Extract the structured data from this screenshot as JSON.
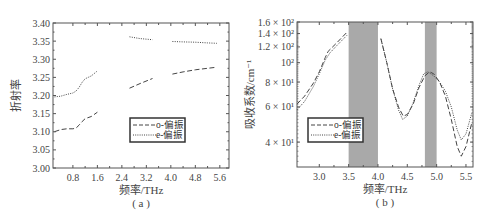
{
  "chart_data": [
    {
      "id": "a",
      "type": "line",
      "caption": "( a )",
      "xlabel": "频率/THz",
      "ylabel": "折射率",
      "xlim": [
        0.15,
        5.9
      ],
      "ylim": [
        3.0,
        3.4
      ],
      "xticks": [
        0.8,
        1.6,
        2.4,
        3.2,
        4.0,
        4.8,
        5.6
      ],
      "xtick_labels": [
        "0.8",
        "1.6",
        "2.4",
        "3.2",
        "4.0",
        "4.8",
        "5.6"
      ],
      "yticks": [
        3.0,
        3.05,
        3.1,
        3.15,
        3.2,
        3.25,
        3.3,
        3.35,
        3.4
      ],
      "ytick_labels": [
        "3.00",
        "3.05",
        "3.10",
        "3.15",
        "3.20",
        "3.25",
        "3.30",
        "3.35",
        "3.40"
      ],
      "grid": false,
      "legend_position": "lower right",
      "series": [
        {
          "name": "o-偏振",
          "style": "dashed",
          "segments": [
            [
              [
                0.2,
                3.1
              ],
              [
                0.4,
                3.106
              ],
              [
                0.6,
                3.108
              ],
              [
                0.8,
                3.108
              ],
              [
                0.9,
                3.11
              ],
              [
                1.0,
                3.118
              ],
              [
                1.1,
                3.128
              ],
              [
                1.2,
                3.136
              ],
              [
                1.4,
                3.142
              ],
              [
                1.6,
                3.154
              ]
            ],
            [
              [
                2.65,
                3.22
              ],
              [
                3.0,
                3.233
              ],
              [
                3.4,
                3.247
              ]
            ],
            [
              [
                4.05,
                3.259
              ],
              [
                4.4,
                3.265
              ],
              [
                4.8,
                3.271
              ],
              [
                5.2,
                3.275
              ],
              [
                5.5,
                3.278
              ]
            ]
          ]
        },
        {
          "name": "e-偏振",
          "style": "dotted",
          "segments": [
            [
              [
                0.2,
                3.196
              ],
              [
                0.4,
                3.198
              ],
              [
                0.6,
                3.203
              ],
              [
                0.8,
                3.207
              ],
              [
                0.9,
                3.212
              ],
              [
                1.0,
                3.222
              ],
              [
                1.1,
                3.236
              ],
              [
                1.2,
                3.246
              ],
              [
                1.4,
                3.254
              ],
              [
                1.6,
                3.268
              ]
            ],
            [
              [
                2.65,
                3.362
              ],
              [
                3.0,
                3.357
              ],
              [
                3.4,
                3.354
              ]
            ],
            [
              [
                4.05,
                3.349
              ],
              [
                4.4,
                3.348
              ],
              [
                4.8,
                3.347
              ],
              [
                5.2,
                3.345
              ],
              [
                5.5,
                3.344
              ]
            ]
          ]
        }
      ]
    },
    {
      "id": "b",
      "type": "line",
      "caption": "( b )",
      "xlabel": "频率/THz",
      "ylabel": "吸收系数/cm⁻¹",
      "yscale": "log",
      "xlim": [
        2.62,
        5.62
      ],
      "ylim": [
        30,
        160
      ],
      "xticks": [
        3.0,
        3.5,
        4.0,
        4.5,
        5.0,
        5.5
      ],
      "xtick_labels": [
        "3.0",
        "3.5",
        "4.0",
        "4.5",
        "5.0",
        "5.5"
      ],
      "yticks": [
        40,
        60,
        80,
        100,
        120,
        140,
        160
      ],
      "ytick_labels": [
        "4 × 10¹",
        "6 × 10¹",
        "8 × 10¹",
        "10²",
        "1.2 × 10²",
        "1.4 × 10²",
        "1.6 × 10²"
      ],
      "grid": false,
      "legend_position": "lower left",
      "shaded_bands": [
        {
          "x0": 3.5,
          "x1": 4.0,
          "color": "#a9a9a9"
        },
        {
          "x0": 4.8,
          "x1": 5.0,
          "color": "#a9a9a9"
        }
      ],
      "series": [
        {
          "name": "o-偏振",
          "style": "dashed",
          "segments": [
            [
              [
                2.62,
                62
              ],
              [
                2.75,
                68
              ],
              [
                2.9,
                79
              ],
              [
                3.0,
                90
              ],
              [
                3.1,
                106
              ],
              [
                3.15,
                114
              ],
              [
                3.3,
                126
              ],
              [
                3.47,
                142
              ]
            ],
            [
              [
                4.05,
                132
              ],
              [
                4.15,
                100
              ],
              [
                4.25,
                74
              ],
              [
                4.35,
                60
              ],
              [
                4.43,
                54
              ],
              [
                4.5,
                55
              ],
              [
                4.6,
                62
              ],
              [
                4.7,
                75
              ],
              [
                4.8,
                86
              ],
              [
                4.88,
                90
              ],
              [
                4.95,
                88
              ],
              [
                5.05,
                80
              ],
              [
                5.15,
                68
              ],
              [
                5.25,
                52
              ],
              [
                5.35,
                38
              ],
              [
                5.42,
                34
              ],
              [
                5.5,
                38
              ],
              [
                5.6,
                50
              ]
            ]
          ]
        },
        {
          "name": "e-偏振",
          "style": "dotted",
          "segments": [
            [
              [
                2.62,
                58
              ],
              [
                2.75,
                64
              ],
              [
                2.9,
                76
              ],
              [
                3.0,
                88
              ],
              [
                3.1,
                103
              ],
              [
                3.18,
                112
              ],
              [
                3.3,
                122
              ],
              [
                3.47,
                137
              ]
            ],
            [
              [
                4.05,
                132
              ],
              [
                4.15,
                100
              ],
              [
                4.25,
                74
              ],
              [
                4.35,
                58
              ],
              [
                4.42,
                52
              ],
              [
                4.5,
                54
              ],
              [
                4.6,
                63
              ],
              [
                4.7,
                77
              ],
              [
                4.78,
                88
              ],
              [
                4.85,
                90
              ],
              [
                4.95,
                86
              ],
              [
                5.05,
                80
              ],
              [
                5.15,
                72
              ],
              [
                5.25,
                60
              ],
              [
                5.35,
                46
              ],
              [
                5.42,
                41
              ],
              [
                5.5,
                44
              ],
              [
                5.6,
                56
              ]
            ]
          ]
        }
      ]
    }
  ],
  "legend": {
    "a": [
      {
        "label": "o-偏振",
        "style": "dashed"
      },
      {
        "label": "e-偏振",
        "style": "dotted"
      }
    ],
    "b": [
      {
        "label": "o-偏振",
        "style": "dashed"
      },
      {
        "label": "e-偏振",
        "style": "dotted"
      }
    ]
  },
  "colors": {
    "axis": "#555555",
    "line": "#444444",
    "band": "#a9a9a9"
  }
}
